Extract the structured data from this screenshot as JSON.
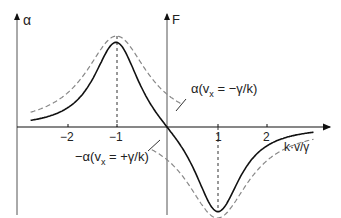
{
  "chart_data": {
    "type": "line",
    "title": "",
    "xlabel": "k·v/γ",
    "ylabel_left": "α",
    "ylabel_right": "F",
    "x_ticks": [
      "−2",
      "−1",
      "1",
      "2"
    ],
    "xlim": [
      -2.7,
      3.0
    ],
    "ylim": [
      -1.0,
      1.0
    ],
    "grid": false,
    "series": [
      {
        "name": "F (total friction force)",
        "style": "solid",
        "description": "Sum of two Lorentzians; max +1 at k·v/γ = −1, min −1 at +1, zero at 0"
      },
      {
        "name": "α(vx = −γ/k)",
        "style": "dashed",
        "description": "Lorentzian absorption peaked at k·v/γ = −1"
      },
      {
        "name": "−α(vx = +γ/k)",
        "style": "dashed",
        "description": "Negative Lorentzian centered at k·v/γ = +1"
      }
    ],
    "annotations": [
      "α(vx = −γ/k)",
      "−α(vx = +γ/k)"
    ]
  },
  "labels": {
    "alpha_axis": "α",
    "force_axis": "F",
    "x_axis": "k·v/γ",
    "ann_top": "α(v",
    "ann_top_sub": "x",
    "ann_top_rest": " = −γ/k)",
    "ann_bot": "−α(v",
    "ann_bot_sub": "x",
    "ann_bot_rest": " = +γ/k)",
    "tick_m2": "−2",
    "tick_m1": "−1",
    "tick_p1": "1",
    "tick_p2": "2"
  }
}
